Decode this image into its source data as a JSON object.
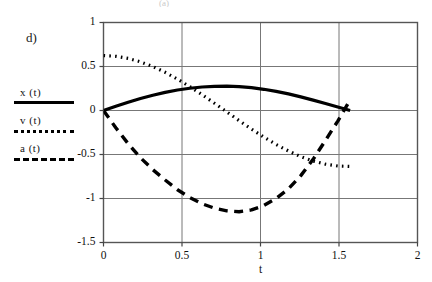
{
  "figure": {
    "panel_label": "d)",
    "scan_artifact": "(a)"
  },
  "legend": {
    "items": [
      {
        "label": "x (t)",
        "style": "solid",
        "name": "legend-item-x"
      },
      {
        "label": "v (t)",
        "style": "dotted",
        "name": "legend-item-v"
      },
      {
        "label": "a (t)",
        "style": "dashed",
        "name": "legend-item-a"
      }
    ]
  },
  "axes": {
    "x_ticks": [
      "0",
      "0.5",
      "1",
      "1.5",
      "2"
    ],
    "y_ticks": [
      "1",
      "0.5",
      "0",
      "-0.5",
      "-1",
      "-1.5"
    ],
    "xlabel": "t",
    "ylabel": ""
  },
  "chart_data": {
    "type": "line",
    "title": "",
    "xlabel": "t",
    "ylabel": "",
    "xlim": [
      0,
      2
    ],
    "ylim": [
      -1.5,
      1
    ],
    "xticks": [
      0,
      0.5,
      1,
      1.5,
      2
    ],
    "yticks": [
      -1.5,
      -1,
      -0.5,
      0,
      0.5,
      1
    ],
    "grid": true,
    "legend_position": "left-outside",
    "x_domain_end": 1.5708,
    "series": [
      {
        "name": "x (t)",
        "style": "solid",
        "color": "#000000",
        "x": [
          0.0,
          0.0785,
          0.1571,
          0.2356,
          0.3142,
          0.3927,
          0.4712,
          0.5498,
          0.6283,
          0.7069,
          0.7854,
          0.8639,
          0.9425,
          1.021,
          1.0996,
          1.1781,
          1.2566,
          1.3352,
          1.4137,
          1.4923,
          1.5708
        ],
        "y": [
          0.0,
          0.048,
          0.094,
          0.136,
          0.174,
          0.206,
          0.233,
          0.253,
          0.267,
          0.274,
          0.276,
          0.271,
          0.259,
          0.241,
          0.218,
          0.189,
          0.155,
          0.118,
          0.079,
          0.039,
          0.0
        ]
      },
      {
        "name": "v (t)",
        "style": "dotted",
        "color": "#000000",
        "x": [
          0.0,
          0.0785,
          0.1571,
          0.2356,
          0.3142,
          0.3927,
          0.4712,
          0.5498,
          0.6283,
          0.7069,
          0.7854,
          0.8639,
          0.9425,
          1.021,
          1.0996,
          1.1781,
          1.2566,
          1.3352,
          1.4137,
          1.4923,
          1.5708
        ],
        "y": [
          0.624,
          0.616,
          0.592,
          0.553,
          0.5,
          0.434,
          0.357,
          0.271,
          0.179,
          0.082,
          -0.016,
          -0.115,
          -0.211,
          -0.302,
          -0.386,
          -0.46,
          -0.524,
          -0.574,
          -0.61,
          -0.631,
          -0.636
        ]
      },
      {
        "name": "a (t)",
        "style": "dashed",
        "color": "#000000",
        "x": [
          0.0,
          0.0785,
          0.1571,
          0.2356,
          0.3142,
          0.3927,
          0.4712,
          0.5498,
          0.6283,
          0.7069,
          0.7854,
          0.8639,
          0.9425,
          1.021,
          1.0996,
          1.1781,
          1.2566,
          1.3352,
          1.4137,
          1.4923,
          1.5708
        ],
        "y": [
          0.0,
          -0.196,
          -0.377,
          -0.537,
          -0.672,
          -0.79,
          -0.9,
          -0.99,
          -1.06,
          -1.11,
          -1.14,
          -1.15,
          -1.13,
          -1.08,
          -1.0,
          -0.89,
          -0.74,
          -0.555,
          -0.34,
          -0.12,
          0.12
        ]
      }
    ]
  }
}
